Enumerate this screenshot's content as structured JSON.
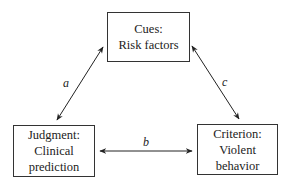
{
  "nodes": {
    "cues": {
      "line1": "Cues:",
      "line2": "Risk factors"
    },
    "judgment": {
      "line1": "Judgment:",
      "line2": "Clinical",
      "line3": "prediction"
    },
    "criterion": {
      "line1": "Criterion:",
      "line2": "Violent",
      "line3": "behavior"
    }
  },
  "edges": {
    "a": {
      "label": "a",
      "from": "cues",
      "to": "judgment",
      "bidirectional": true
    },
    "b": {
      "label": "b",
      "from": "judgment",
      "to": "criterion",
      "bidirectional": true
    },
    "c": {
      "label": "c",
      "from": "cues",
      "to": "criterion",
      "bidirectional": true
    }
  }
}
